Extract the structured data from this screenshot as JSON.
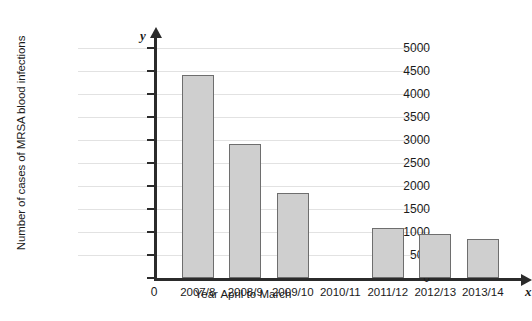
{
  "chart_data": {
    "type": "bar",
    "title": "",
    "subtitle": "",
    "xlabel": "Year April to March",
    "ylabel": "Number of cases of MRSA blood infections",
    "x_axis_tip_label": "x",
    "y_axis_tip_label": "y",
    "origin_label": "0",
    "categories": [
      "2007/8",
      "2008/9",
      "2009/10",
      "2010/11",
      "2011/12",
      "2012/13",
      "2013/14"
    ],
    "values": [
      4400,
      2900,
      1850,
      0,
      1080,
      950,
      850
    ],
    "ylim": [
      0,
      5250
    ],
    "ytick_values": [
      0,
      500,
      1000,
      1500,
      2000,
      2500,
      3000,
      3500,
      4000,
      4500,
      5000
    ],
    "ytick_labels": [
      "0",
      "500",
      "1000",
      "1500",
      "2000",
      "2500",
      "3000",
      "3500",
      "4000",
      "4500",
      "5000"
    ],
    "grid": true,
    "legend": "none",
    "bar_fill_color": "#cfcfcf",
    "bar_border_color": "#6e6e6e",
    "axis_color": "#2b2b2b",
    "gridline_color": "#e2e2e2",
    "background_color": "#ffffff"
  }
}
